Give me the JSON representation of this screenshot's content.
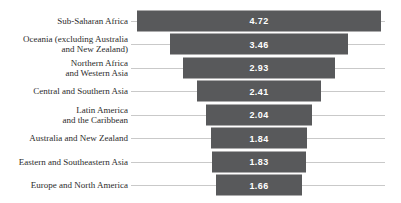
{
  "chart_data": {
    "type": "bar",
    "orientation": "horizontal_centered_funnel",
    "title": "",
    "xlabel": "",
    "ylabel": "",
    "grid": "off",
    "legend": "none",
    "bars_centered_on_common_axis": true,
    "value_range": [
      0,
      4.72
    ],
    "categories": [
      "Sub-Saharan Africa",
      "Oceania (excluding Australia\nand New Zealand)",
      "Northern Africa\nand Western Asia",
      "Central and Southern Asia",
      "Latin America\nand the Caribbean",
      "Australia and New Zealand",
      "Eastern and Southeastern Asia",
      "Europe and North America"
    ],
    "values": [
      4.72,
      3.46,
      2.93,
      2.41,
      2.04,
      1.84,
      1.83,
      1.66
    ],
    "value_labels": [
      "4.72",
      "3.46",
      "2.93",
      "2.41",
      "2.04",
      "1.84",
      "1.83",
      "1.66"
    ],
    "colors": {
      "bar": "#58595b",
      "row_line": "#c9c9c9",
      "value_text": "#ffffff",
      "label_text": "#2b2b2b",
      "background": "#ffffff"
    }
  }
}
